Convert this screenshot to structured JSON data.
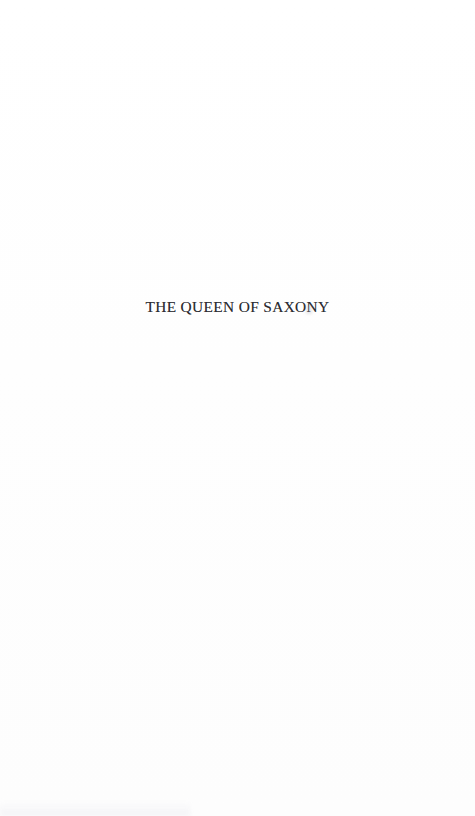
{
  "document": {
    "kind": "scanned-book-page",
    "page_background_color": "#ffffff",
    "page_width_px": 475,
    "page_height_px": 816
  },
  "half_title": {
    "text": "THE QUEEN OF SAXONY",
    "color": "#2c2c31",
    "alignment": "center",
    "typeface_style": "serif",
    "case": "uppercase"
  },
  "body": {
    "text": "",
    "note": ""
  },
  "artifacts": {
    "ink_fleck_label": "ink-fleck",
    "bottom_smudge_label": "scanner-smudge"
  }
}
